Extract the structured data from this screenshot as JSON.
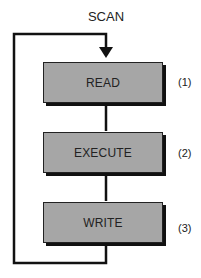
{
  "diagram": {
    "title": "SCAN",
    "steps": [
      {
        "label": "READ",
        "number": "(1)"
      },
      {
        "label": "EXECUTE",
        "number": "(2)"
      },
      {
        "label": "WRITE",
        "number": "(3)"
      }
    ],
    "colors": {
      "box_fill": "#a6a6a6",
      "line": "#111111",
      "shadow": "#111111"
    }
  }
}
